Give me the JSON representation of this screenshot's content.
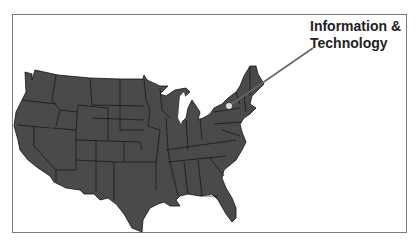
{
  "map": {
    "title": "United States map",
    "fill_color": "#4a4a4a",
    "border_color": "#111111",
    "background": "#ffffff"
  },
  "callout": {
    "line1": "Information &",
    "line2": "Technology",
    "marker_color": "#dddddd",
    "leader_color": "#666666"
  }
}
